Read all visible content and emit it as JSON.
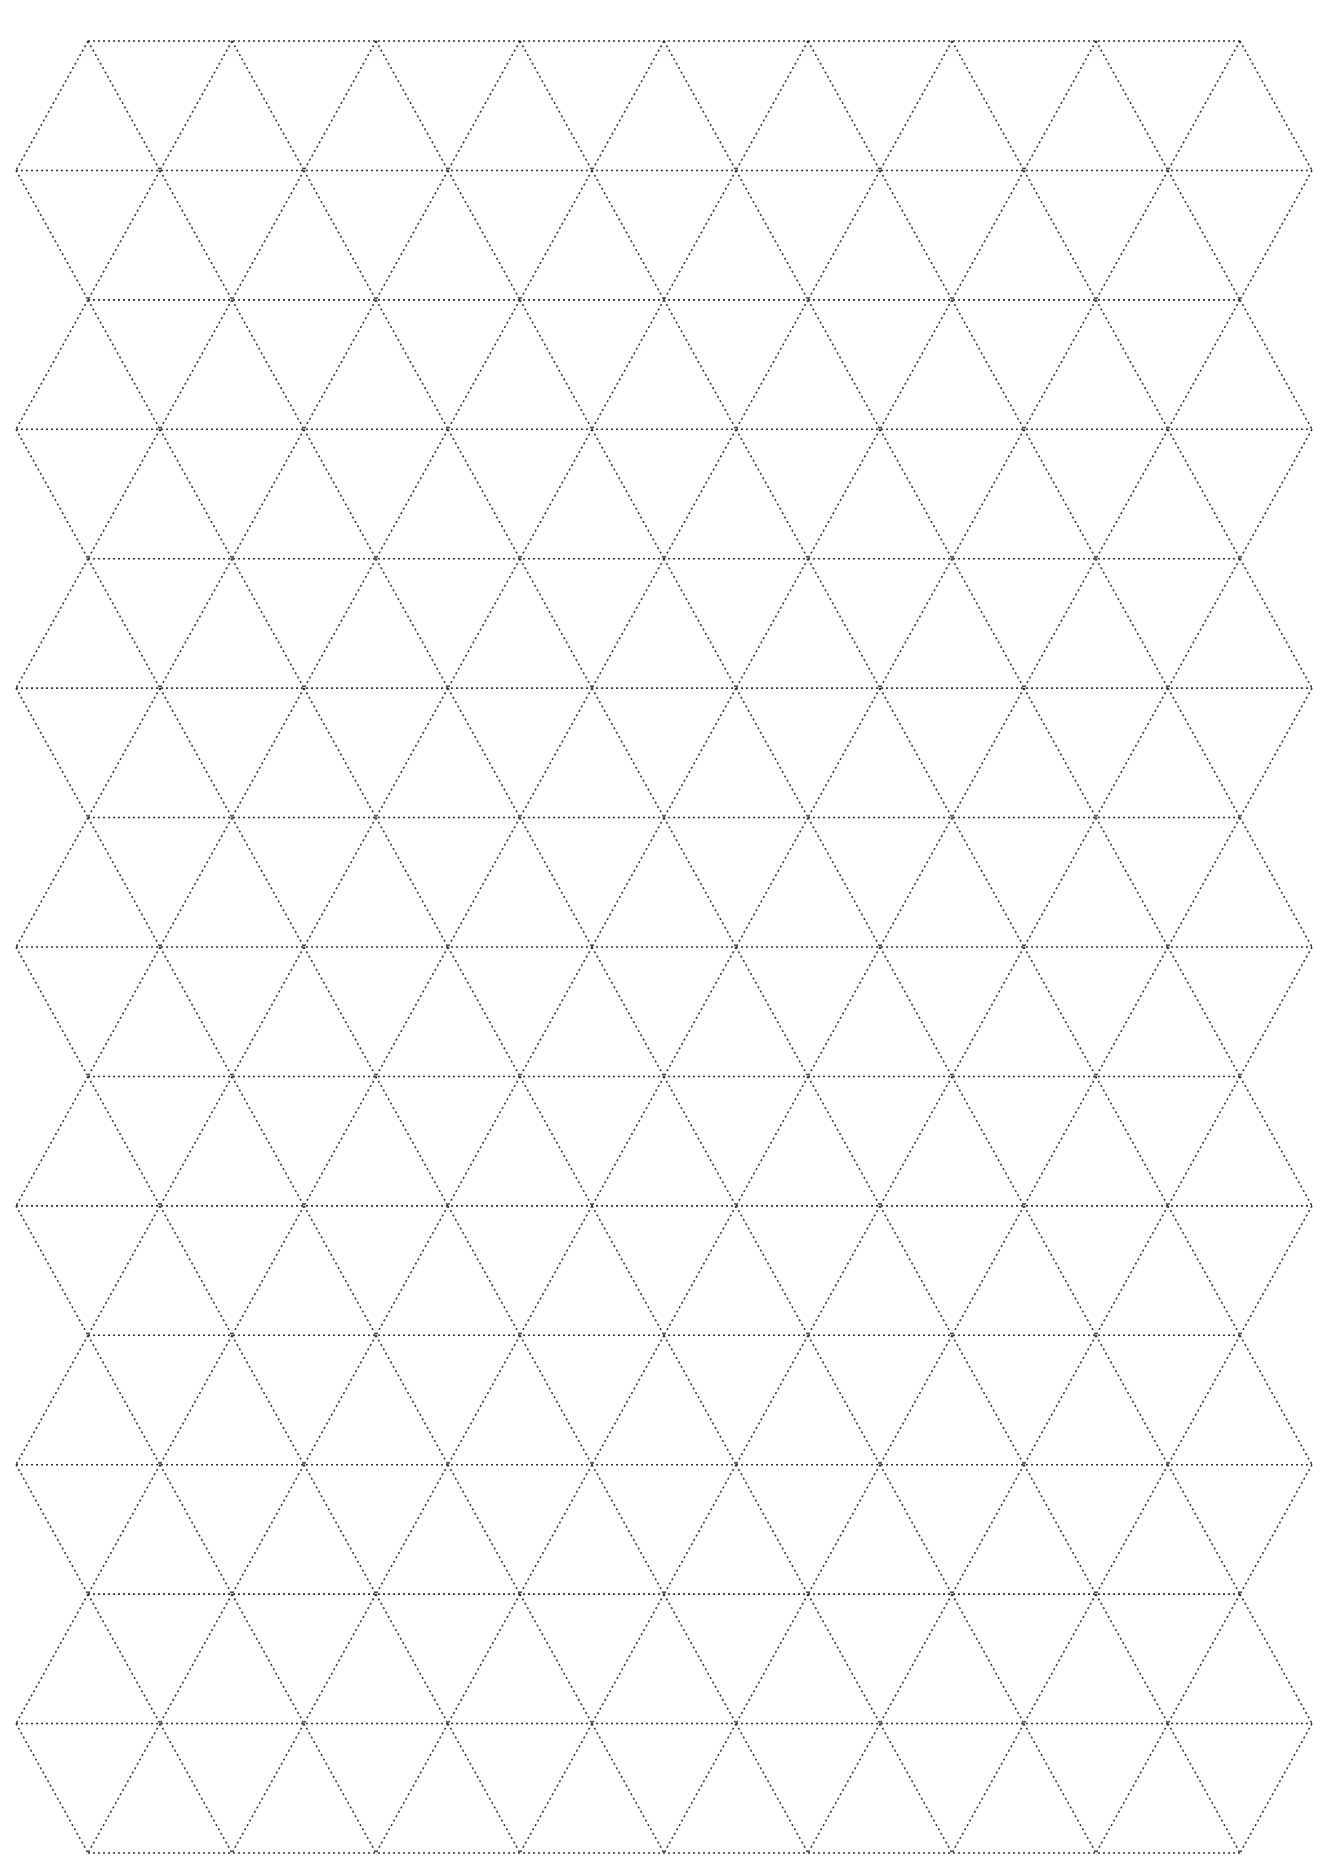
{
  "page": {
    "type": "isometric-triangle-grid-paper",
    "background": "#ffffff",
    "line_color": "#333333",
    "line_style": "dotted"
  },
  "grid": {
    "rows": 15,
    "top_y": 41,
    "bottom_y": 1853,
    "cell_width": 144,
    "even_row_x_start": 88,
    "even_row_x_end": 1244,
    "odd_row_x_start": 16,
    "odd_row_x_end": 1316
  }
}
